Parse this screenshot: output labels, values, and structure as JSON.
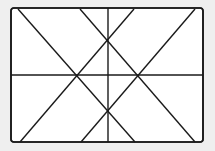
{
  "diagram": {
    "background": "#efefef",
    "frame": {
      "x": 11,
      "y": 8,
      "width": 192,
      "height": 134,
      "radius": 3,
      "fill": "#ffffff",
      "stroke": "#1a1a1a",
      "stroke_width": 1.6
    },
    "line_color": "#1a1a1a",
    "lines": [
      {
        "name": "diagonal-1",
        "x1": 18,
        "y1": 9,
        "x2": 135,
        "y2": 142
      },
      {
        "name": "diagonal-2",
        "x1": 134,
        "y1": 9,
        "x2": 20,
        "y2": 142
      },
      {
        "name": "diagonal-3",
        "x1": 80,
        "y1": 9,
        "x2": 195,
        "y2": 142
      },
      {
        "name": "diagonal-4",
        "x1": 195,
        "y1": 9,
        "x2": 81,
        "y2": 142
      },
      {
        "name": "vertical-center",
        "x1": 108,
        "y1": 8,
        "x2": 108,
        "y2": 142
      },
      {
        "name": "horizontal-center",
        "x1": 11,
        "y1": 75,
        "x2": 203,
        "y2": 75
      }
    ]
  }
}
